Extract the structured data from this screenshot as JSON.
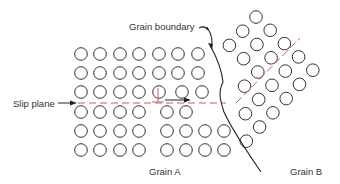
{
  "diagram": {
    "labels": {
      "grain_boundary": "Grain boundary",
      "slip_plane": "Slip plane",
      "grain_a": "Grain A",
      "grain_b": "Grain B"
    },
    "colors": {
      "atom_stroke": "#333333",
      "boundary": "#222222",
      "slip_line": "#c0645a",
      "arrow": "#222222"
    }
  }
}
